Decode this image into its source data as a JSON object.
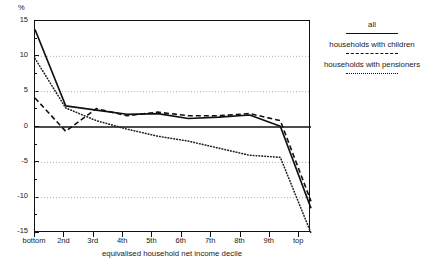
{
  "chart_data": {
    "type": "line",
    "title": "",
    "xlabel": "equivalised household net income decile",
    "ylabel": "%",
    "ylim": [
      -15,
      15
    ],
    "yticks": [
      15,
      10,
      5,
      0,
      -5,
      -10,
      -15
    ],
    "yticks_labels": [
      "15",
      "10",
      "5",
      "0",
      "-5",
      "-10",
      "-15"
    ],
    "grid": "horizontal dotted gridlines at 10, 5, -5, -10; solid zero line",
    "legend_position": "right",
    "categories": [
      "bottom",
      "2nd",
      "3rd",
      "4th",
      "5th",
      "6th",
      "7th",
      "8th",
      "9th",
      "top"
    ],
    "series": [
      {
        "name": "all",
        "style": "solid",
        "values": [
          13.8,
          3.0,
          2.4,
          1.8,
          1.9,
          1.2,
          1.4,
          1.7,
          0.1,
          -11.5
        ]
      },
      {
        "name": "households with children",
        "style": "dashed",
        "values": [
          4.1,
          -0.6,
          2.6,
          1.6,
          2.1,
          1.6,
          1.6,
          1.9,
          0.9,
          -10.5
        ]
      },
      {
        "name": "households with pensioners",
        "style": "dotted",
        "values": [
          9.7,
          2.7,
          0.9,
          -0.3,
          -1.3,
          -2.0,
          -3.0,
          -4.0,
          -4.3,
          -15.0
        ]
      }
    ]
  },
  "axes": {
    "y_unit_label": "%",
    "x_axis_title": "equivalised household net income decile",
    "y_tick_labels": [
      "15",
      "10",
      "5",
      "0",
      "-5",
      "-10",
      "-15"
    ],
    "x_tick_labels": [
      "bottom",
      "2nd",
      "3rd",
      "4th",
      "5th",
      "6th",
      "7th",
      "8th",
      "9th",
      "top"
    ]
  },
  "legend": {
    "entries": [
      {
        "label": "all",
        "style": "solid"
      },
      {
        "label": "households with children",
        "style": "dashed"
      },
      {
        "label": "households with pensioners",
        "style": "dotted"
      }
    ]
  }
}
